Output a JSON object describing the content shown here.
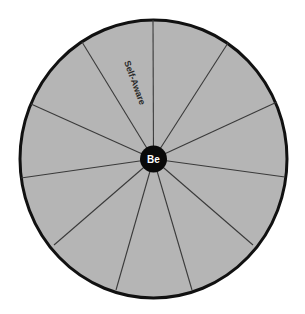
{
  "diagram": {
    "type": "wheel",
    "colors": {
      "fill": "#b5b5b5",
      "outline": "#111111",
      "spoke": "#3a3a3a",
      "hub": "#0a0a0a",
      "hub_text": "#ffffff",
      "label_text": "#2a2a2a"
    },
    "hub": {
      "label": "Be"
    },
    "segment_count": 11,
    "segments": [
      {
        "label": "Self-Aware"
      }
    ]
  }
}
